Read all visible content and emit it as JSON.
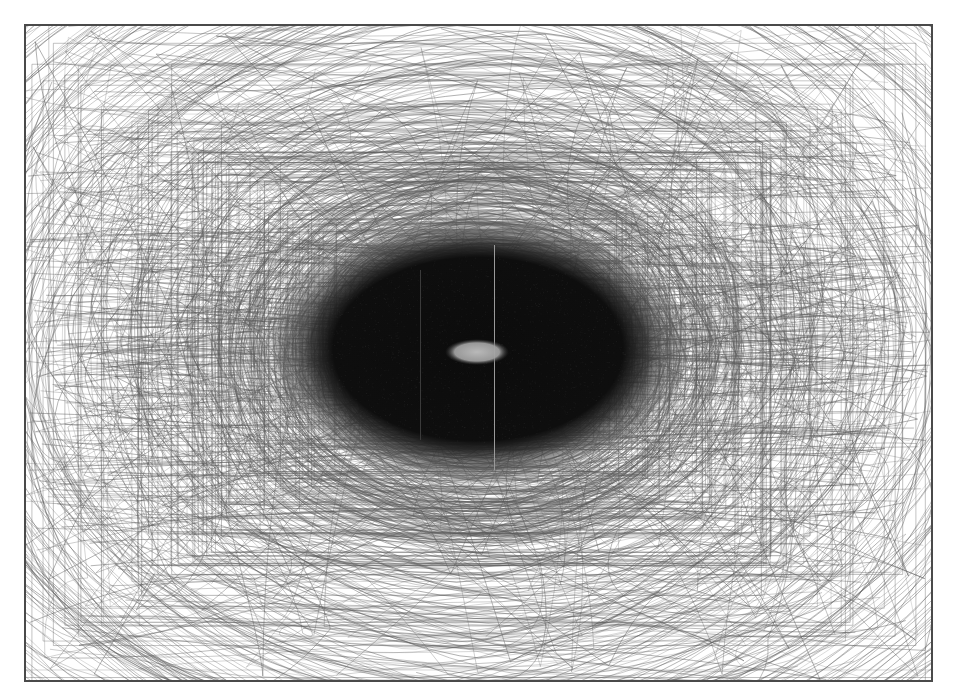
{
  "figure": {
    "description": "Overlay of many gaze/scan trajectories forming a dense central density region with a bright central fixation spot",
    "frame": {
      "x": 24,
      "y": 24,
      "width": 907,
      "height": 656,
      "border_color": "#4a4a4a"
    },
    "background_color": "#ffffff",
    "line_color": "#6e6e6e",
    "core_color": "#0f0f0f",
    "center_spot_color": "#a8a8a8"
  },
  "density_core": {
    "cx": 478,
    "cy": 349,
    "rx": 158,
    "ry": 93
  },
  "center_spot": {
    "cx": 477,
    "cy": 352,
    "rx": 32,
    "ry": 13
  },
  "vertical_artifacts": [
    {
      "x": 494,
      "y1": 245,
      "y2": 470,
      "color": "#9a9a9a"
    },
    {
      "x": 420,
      "y1": 270,
      "y2": 440,
      "color": "#3a3a3a"
    }
  ],
  "trajectories": {
    "count": 900,
    "seed": 7
  }
}
